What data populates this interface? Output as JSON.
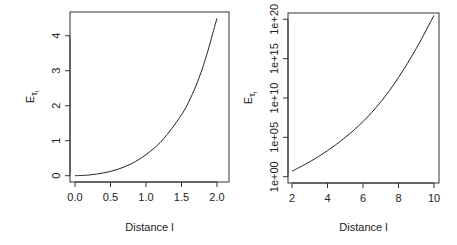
{
  "chart_data": [
    {
      "type": "line",
      "title": "",
      "xlabel": "Distance l",
      "ylabel": "Eτ_l",
      "ylabel_main": "E",
      "ylabel_sub": "τ",
      "ylabel_subsub": "l",
      "xlim": [
        0,
        2
      ],
      "ylim": [
        0,
        4.5
      ],
      "y_scale": "linear",
      "x_ticks": [
        0,
        0.5,
        1,
        1.5,
        2
      ],
      "x_tick_labels": [
        "0.0",
        "0.5",
        "1.0",
        "1.5",
        "2.0"
      ],
      "y_ticks": [
        0,
        1,
        2,
        3,
        4
      ],
      "y_tick_labels": [
        "0",
        "1",
        "2",
        "3",
        "4"
      ],
      "grid": false,
      "series": [
        {
          "name": "Eτ_l",
          "x": [
            0.0,
            0.2,
            0.4,
            0.6,
            0.8,
            1.0,
            1.2,
            1.4,
            1.6,
            1.8,
            2.0
          ],
          "y": [
            0.0,
            0.02,
            0.08,
            0.18,
            0.35,
            0.6,
            0.95,
            1.45,
            2.1,
            3.1,
            4.5
          ]
        }
      ]
    },
    {
      "type": "line",
      "title": "",
      "xlabel": "Distance l",
      "ylabel": "Eτ_l",
      "ylabel_main": "E",
      "ylabel_sub": "τ",
      "ylabel_subsub": "l",
      "xlim": [
        2,
        10
      ],
      "ylim": [
        1,
        1e+20
      ],
      "y_scale": "log",
      "x_ticks": [
        2,
        4,
        6,
        8,
        10
      ],
      "x_tick_labels": [
        "2",
        "4",
        "6",
        "8",
        "10"
      ],
      "y_ticks_log10": [
        0,
        5,
        10,
        15,
        20
      ],
      "y_tick_labels": [
        "1e+00",
        "1e+05",
        "1e+10",
        "1e+15",
        "1e+20"
      ],
      "grid": false,
      "series": [
        {
          "name": "Eτ_l",
          "x": [
            2,
            3,
            4,
            5,
            6,
            7,
            8,
            9,
            10
          ],
          "log10_y": [
            0.7,
            1.9,
            3.3,
            5.0,
            7.0,
            9.5,
            12.6,
            16.3,
            20.5
          ]
        }
      ]
    }
  ]
}
